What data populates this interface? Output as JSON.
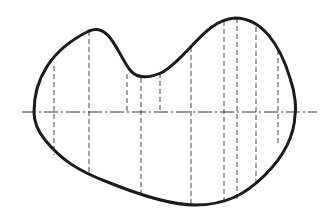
{
  "diagram": {
    "type": "technical-drawing",
    "colors": {
      "background": "#ffffff",
      "outline": "#1a1a1a",
      "lines": "#444444"
    },
    "outline_path": "M 34 112 C 34 80 50 50 89 31 C 110 22 118 55 130 70 C 138 80 150 78 163 72 C 190 55 205 20 235 18 C 262 18 280 45 290 78 C 296 95 296 110 295 115 C 294 140 280 160 265 175 C 245 195 225 205 195 205 C 170 205 140 195 110 183 C 75 170 60 158 45 140 C 37 130 34 122 34 112 Z",
    "center_axis": {
      "x1": 22,
      "x2": 317,
      "y": 112,
      "style": "dash-dot"
    },
    "section_lines": [
      {
        "x": 54,
        "y1": 66,
        "y2": 155,
        "extent": "full"
      },
      {
        "x": 89,
        "y1": 31,
        "y2": 172,
        "extent": "full"
      },
      {
        "x": 127,
        "y1": 74,
        "y2": 112,
        "extent": "top-to-axis"
      },
      {
        "x": 141,
        "y1": 78,
        "y2": 194,
        "extent": "full"
      },
      {
        "x": 160,
        "y1": 73,
        "y2": 112,
        "extent": "top-to-axis"
      },
      {
        "x": 191,
        "y1": 47,
        "y2": 204,
        "extent": "full"
      },
      {
        "x": 224,
        "y1": 21,
        "y2": 204,
        "extent": "full"
      },
      {
        "x": 237,
        "y1": 18,
        "y2": 199,
        "extent": "full"
      },
      {
        "x": 256,
        "y1": 27,
        "y2": 184,
        "extent": "full"
      },
      {
        "x": 278,
        "y1": 50,
        "y2": 146,
        "extent": "full"
      }
    ]
  }
}
